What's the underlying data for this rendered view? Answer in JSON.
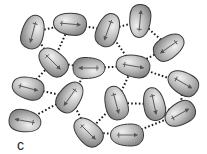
{
  "diagram": {
    "colors": {
      "molecule_fill_light": "#e6e6e6",
      "molecule_fill_dark": "#8a8a8a",
      "molecule_outline": "#3a3a3a",
      "arrow": "#555555",
      "bond_dots": "#1a1a1a"
    },
    "molecules": [
      {
        "id": "m1",
        "x": 33,
        "y": 32,
        "rot": 105,
        "w": 34,
        "h": 22
      },
      {
        "id": "m2",
        "x": 70,
        "y": 24,
        "rot": 5,
        "w": 33,
        "h": 22
      },
      {
        "id": "m3",
        "x": 53,
        "y": 62,
        "rot": 45,
        "w": 33,
        "h": 22
      },
      {
        "id": "m4",
        "x": 89,
        "y": 68,
        "rot": 180,
        "w": 32,
        "h": 21
      },
      {
        "id": "m5",
        "x": 108,
        "y": 30,
        "rot": 110,
        "w": 34,
        "h": 22
      },
      {
        "id": "m6",
        "x": 140,
        "y": 21,
        "rot": -85,
        "w": 33,
        "h": 21
      },
      {
        "id": "m7",
        "x": 169,
        "y": 47,
        "rot": 145,
        "w": 33,
        "h": 22
      },
      {
        "id": "m8",
        "x": 133,
        "y": 66,
        "rot": 10,
        "w": 34,
        "h": 22
      },
      {
        "id": "m9",
        "x": 28,
        "y": 88,
        "rot": 15,
        "w": 32,
        "h": 22
      },
      {
        "id": "m10",
        "x": 70,
        "y": 97,
        "rot": 125,
        "w": 33,
        "h": 22
      },
      {
        "id": "m11",
        "x": 25,
        "y": 121,
        "rot": 190,
        "w": 32,
        "h": 22
      },
      {
        "id": "m12",
        "x": 88,
        "y": 132,
        "rot": 45,
        "w": 33,
        "h": 22
      },
      {
        "id": "m13",
        "x": 116,
        "y": 103,
        "rot": 75,
        "w": 34,
        "h": 22
      },
      {
        "id": "m14",
        "x": 154,
        "y": 104,
        "rot": 78,
        "w": 33,
        "h": 21
      },
      {
        "id": "m15",
        "x": 183,
        "y": 83,
        "rot": 30,
        "w": 32,
        "h": 22
      },
      {
        "id": "m16",
        "x": 180,
        "y": 114,
        "rot": -30,
        "w": 32,
        "h": 22
      },
      {
        "id": "m17",
        "x": 127,
        "y": 135,
        "rot": 0,
        "w": 33,
        "h": 22
      }
    ],
    "bonds": [
      [
        "m1",
        "m2"
      ],
      [
        "m1",
        "m3"
      ],
      [
        "m2",
        "m3"
      ],
      [
        "m2",
        "m5"
      ],
      [
        "m3",
        "m4"
      ],
      [
        "m5",
        "m6"
      ],
      [
        "m6",
        "m7"
      ],
      [
        "m5",
        "m8"
      ],
      [
        "m4",
        "m8"
      ],
      [
        "m8",
        "m7"
      ],
      [
        "m4",
        "m10"
      ],
      [
        "m3",
        "m9"
      ],
      [
        "m9",
        "m10"
      ],
      [
        "m10",
        "m11"
      ],
      [
        "m10",
        "m12"
      ],
      [
        "m8",
        "m13"
      ],
      [
        "m8",
        "m15"
      ],
      [
        "m15",
        "m16"
      ],
      [
        "m14",
        "m16"
      ],
      [
        "m13",
        "m12"
      ],
      [
        "m12",
        "m17"
      ],
      [
        "m17",
        "m16"
      ],
      [
        "m13",
        "m14"
      ]
    ],
    "caption_fragment": "c"
  }
}
